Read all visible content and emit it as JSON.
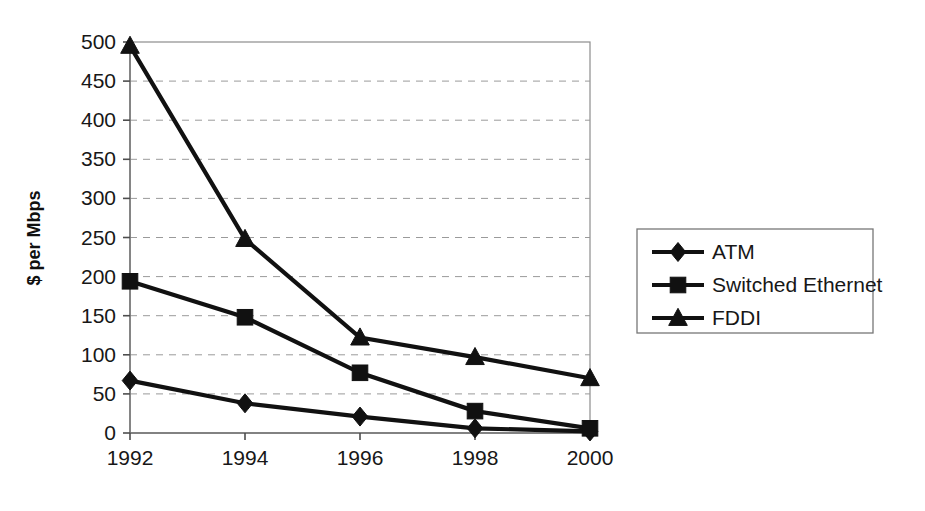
{
  "chart_data": {
    "type": "line",
    "title": "",
    "xlabel": "",
    "ylabel": "$ per Mbps",
    "x": [
      1992,
      1994,
      1996,
      1998,
      2000
    ],
    "categories": [
      "1992",
      "1994",
      "1996",
      "1998",
      "2000"
    ],
    "xtick_labels": [
      "1992",
      "1994",
      "1996",
      "1998",
      "2000"
    ],
    "ytick_labels": [
      "0",
      "50",
      "100",
      "150",
      "200",
      "250",
      "300",
      "350",
      "400",
      "450",
      "500"
    ],
    "ytick_values": [
      0,
      50,
      100,
      150,
      200,
      250,
      300,
      350,
      400,
      450,
      500
    ],
    "ylim": [
      0,
      500
    ],
    "xlim": [
      1992,
      2000
    ],
    "grid": "horizontal-dashed",
    "legend_position": "right-outside",
    "series": [
      {
        "name": "ATM",
        "marker": "diamond",
        "color": "#111111",
        "values": [
          67,
          38,
          21,
          6,
          2
        ]
      },
      {
        "name": "Switched Ethernet",
        "marker": "square",
        "color": "#111111",
        "values": [
          194,
          148,
          77,
          28,
          6
        ]
      },
      {
        "name": "FDDI",
        "marker": "triangle",
        "color": "#111111",
        "values": [
          495,
          248,
          122,
          97,
          70
        ]
      }
    ]
  },
  "legend": {
    "items": [
      {
        "label": "ATM",
        "marker": "diamond"
      },
      {
        "label": "Switched Ethernet",
        "marker": "square"
      },
      {
        "label": "FDDI",
        "marker": "triangle"
      }
    ]
  },
  "axes": {
    "y_title": "$ per Mbps"
  }
}
